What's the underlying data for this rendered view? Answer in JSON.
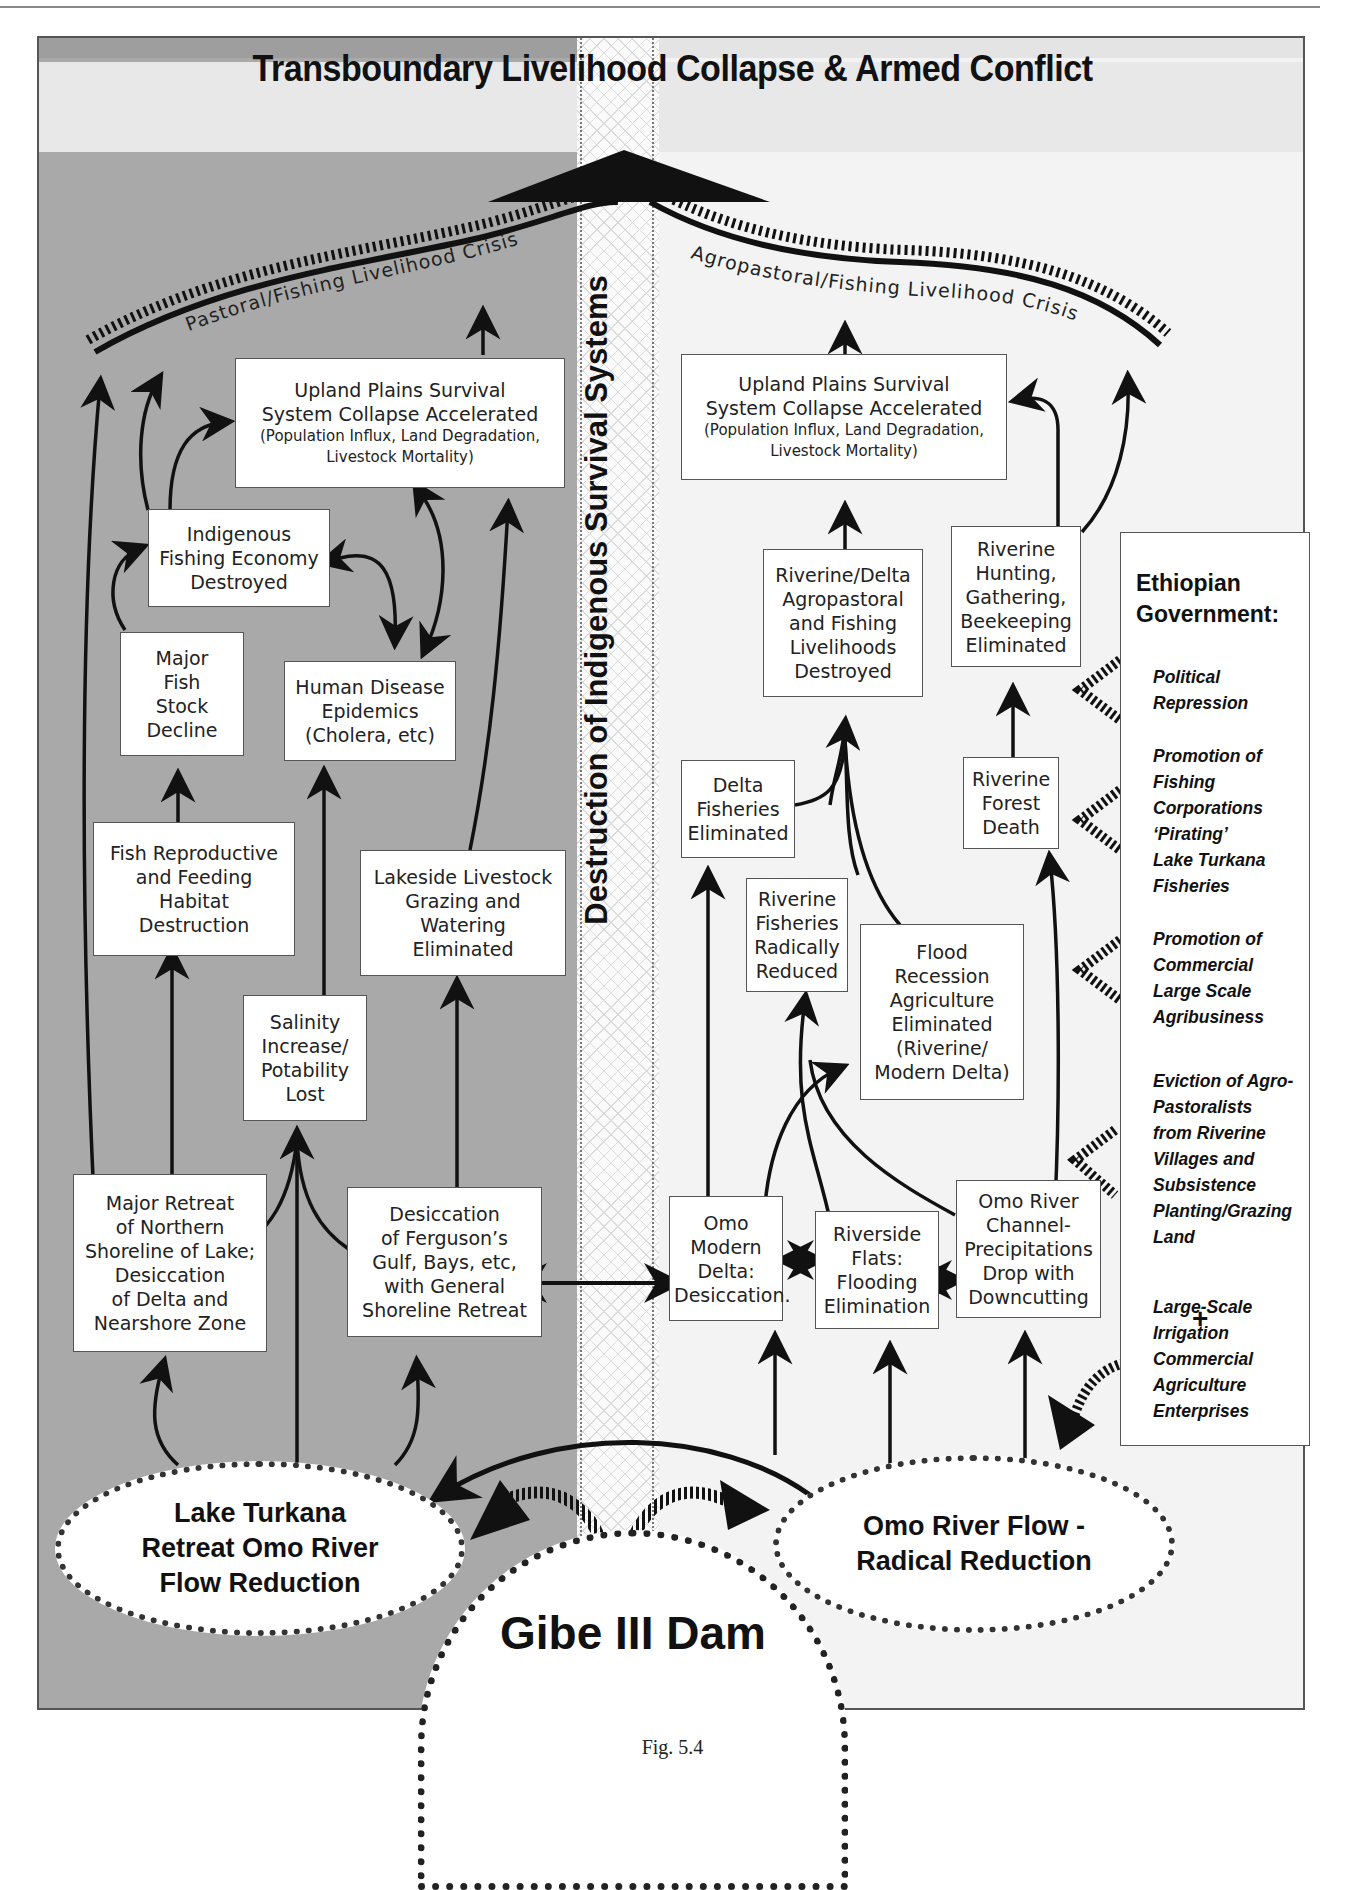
{
  "header": {
    "title": "Transboundary Livelihood Collapse & Armed Conflict"
  },
  "center": {
    "vertical_title": "Destruction of Indigenous Survival Systems"
  },
  "left": {
    "crisis_label": "Pastoral/Fishing Livelihood Crisis",
    "boxes": {
      "upland_title": "Upland Plains Survival\nSystem Collapse Accelerated",
      "upland_sub": "(Population Influx, Land Degradation,\nLivestock Mortality)",
      "fishing_economy": "Indigenous\nFishing Economy\nDestroyed",
      "fish_stock": "Major\nFish\nStock\nDecline",
      "disease": "Human Disease\nEpidemics\n(Cholera, etc)",
      "habitat": "Fish Reproductive\nand Feeding\nHabitat\nDestruction",
      "livestock": "Lakeside Livestock\nGrazing and\nWatering\nEliminated",
      "salinity": "Salinity\nIncrease/\nPotability\nLost",
      "retreat": "Major Retreat\nof Northern\nShoreline of Lake;\nDesiccation\nof Delta and\nNearshore Zone",
      "ferguson": "Desiccation\nof Ferguson’s\nGulf, Bays, etc,\nwith General\nShoreline Retreat"
    },
    "ellipse": "Lake Turkana\nRetreat Omo River\nFlow Reduction"
  },
  "right": {
    "crisis_label": "Agropastoral/Fishing Livelihood Crisis",
    "boxes": {
      "upland_title": "Upland Plains Survival\nSystem Collapse Accelerated",
      "upland_sub": "(Population Influx, Land Degradation,\nLivestock Mortality)",
      "riverine_delta": "Riverine/Delta\nAgropastoral\nand Fishing\nLivelihoods\nDestroyed",
      "hunting": "Riverine\nHunting,\nGathering,\nBeekeeping\nEliminated",
      "delta_fisheries": "Delta\nFisheries\nEliminated",
      "forest": "Riverine\nForest\nDeath",
      "riverine_fisheries": "Riverine\nFisheries\nRadically\nReduced",
      "flood_recession": "Flood\nRecession\nAgriculture\nEliminated\n(Riverine/\nModern Delta)",
      "omo_delta": "Omo\nModern\nDelta:\nDesiccation.",
      "riverside": "Riverside\nFlats:\nFlooding\nElimination",
      "channel": "Omo River\nChannel-\nPrecipitations\nDrop with\nDowncutting"
    },
    "ellipse": "Omo River Flow -\nRadical Reduction"
  },
  "government": {
    "title": "Ethiopian\nGovernment:",
    "items": [
      "Political\nRepression",
      "Promotion of\nFishing\nCorporations\n‘Pirating’\nLake Turkana\nFisheries",
      "Promotion of\nCommercial\nLarge Scale\nAgribusiness",
      "Eviction of Agro-\nPastoralists\nfrom Riverine\nVillages and\nSubsistence\nPlanting/Grazing\nLand",
      "Large-Scale\nIrrigation\nCommercial\nAgriculture\nEnterprises"
    ],
    "plus": "+"
  },
  "dam": {
    "label": "Gibe III Dam"
  },
  "caption": "Fig. 5.4",
  "colors": {
    "left_panel": "#a9a9a9",
    "right_panel": "#f3f3f3",
    "box_fill": "#ffffff",
    "ink": "#111111"
  }
}
